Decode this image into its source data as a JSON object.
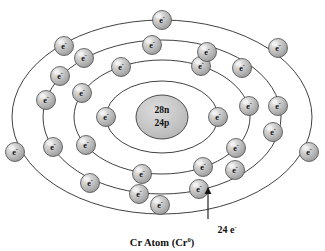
{
  "figure": {
    "caption": "Cr Atom (Cr",
    "caption_superscript": "0",
    "caption_close": ")",
    "annotation_label": "24 e",
    "annotation_superscript": "-"
  },
  "nucleus": {
    "neutrons_label": "28n",
    "protons_label": "24p",
    "fill_color": "#c9c9c9",
    "cx": 162,
    "cy": 117,
    "rx": 26,
    "ry": 22
  },
  "electron": {
    "symbol": "e",
    "charge": "-",
    "fill_color": "#b8b8b8",
    "highlight_color": "#f2f2f2",
    "radius": 9.5
  },
  "shells": [
    {
      "name": "shell-1-K",
      "electron_count": 2,
      "rx": 56,
      "ry": 36
    },
    {
      "name": "shell-2-L",
      "electron_count": 8,
      "rx": 88,
      "ry": 57
    },
    {
      "name": "shell-3-M",
      "electron_count": 13,
      "rx": 119,
      "ry": 77
    },
    {
      "name": "shell-4-N",
      "electron_count": 1,
      "rx": 150,
      "ry": 97
    }
  ],
  "chart_data": {
    "type": "scatter",
    "title": "Cr Atom (Cr0)",
    "nucleus": {
      "neutrons": 28,
      "protons": 24
    },
    "total_electrons": 24,
    "shell_occupancy": [
      2,
      8,
      13,
      1
    ],
    "shell_names": [
      "K",
      "L",
      "M",
      "N"
    ],
    "annotation": "24 e-",
    "electrons": [
      {
        "shell": 1,
        "angle_deg": 180,
        "x": 106,
        "y": 117
      },
      {
        "shell": 1,
        "angle_deg": 0,
        "x": 218,
        "y": 117
      },
      {
        "shell": 2,
        "angle_deg": 205,
        "x": 82,
        "y": 93
      },
      {
        "shell": 2,
        "angle_deg": 150,
        "x": 86,
        "y": 145
      },
      {
        "shell": 2,
        "angle_deg": 103,
        "x": 142,
        "y": 174
      },
      {
        "shell": 2,
        "angle_deg": 62,
        "x": 203,
        "y": 167
      },
      {
        "shell": 2,
        "angle_deg": 33,
        "x": 236,
        "y": 148
      },
      {
        "shell": 2,
        "angle_deg": 349,
        "x": 249,
        "y": 106
      },
      {
        "shell": 2,
        "angle_deg": 296,
        "x": 201,
        "y": 66
      },
      {
        "shell": 2,
        "angle_deg": 242,
        "x": 121,
        "y": 67
      },
      {
        "shell": 3,
        "angle_deg": 193,
        "x": 46,
        "y": 100
      },
      {
        "shell": 3,
        "angle_deg": 157,
        "x": 53,
        "y": 147
      },
      {
        "shell": 3,
        "angle_deg": 128,
        "x": 90,
        "y": 183
      },
      {
        "shell": 3,
        "angle_deg": 100,
        "x": 139,
        "y": 194
      },
      {
        "shell": 3,
        "angle_deg": 72,
        "x": 199,
        "y": 189
      },
      {
        "shell": 3,
        "angle_deg": 48,
        "x": 235,
        "y": 170
      },
      {
        "shell": 3,
        "angle_deg": 20,
        "x": 273,
        "y": 132
      },
      {
        "shell": 3,
        "angle_deg": 352,
        "x": 278,
        "y": 106
      },
      {
        "shell": 3,
        "angle_deg": 318,
        "x": 242,
        "y": 68
      },
      {
        "shell": 3,
        "angle_deg": 290,
        "x": 207,
        "y": 52
      },
      {
        "shell": 3,
        "angle_deg": 262,
        "x": 152,
        "y": 45
      },
      {
        "shell": 3,
        "angle_deg": 232,
        "x": 84,
        "y": 58
      },
      {
        "shell": 3,
        "angle_deg": 212,
        "x": 60,
        "y": 76
      },
      {
        "shell": 4,
        "angle_deg": 270,
        "x": 162,
        "y": 20
      }
    ],
    "extra_outer_electrons": [
      {
        "x": 15,
        "y": 152
      },
      {
        "x": 64,
        "y": 46
      },
      {
        "x": 278,
        "y": 48
      },
      {
        "x": 309,
        "y": 152
      },
      {
        "x": 160,
        "y": 205
      }
    ],
    "xlabel": "",
    "ylabel": "",
    "grid": false,
    "legend": "none"
  }
}
